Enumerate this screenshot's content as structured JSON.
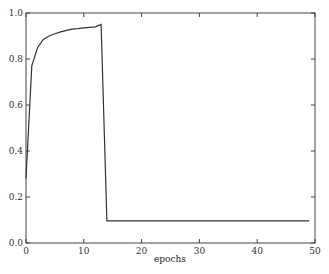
{
  "chart_data": {
    "type": "line",
    "title": "",
    "xlabel": "epochs",
    "ylabel": "",
    "xlim": [
      0,
      50
    ],
    "ylim": [
      0.0,
      1.0
    ],
    "grid": false,
    "xticks": [
      0,
      10,
      20,
      30,
      40,
      50
    ],
    "yticks": [
      0.0,
      0.2,
      0.4,
      0.6,
      0.8,
      1.0
    ],
    "xtick_labels": [
      "0",
      "10",
      "20",
      "30",
      "40",
      "50"
    ],
    "ytick_labels": [
      "0.0",
      "0.2",
      "0.4",
      "0.6",
      "0.8",
      "1.0"
    ],
    "series": [
      {
        "name": "accuracy",
        "color": "#333333",
        "x": [
          0,
          1,
          2,
          3,
          4,
          5,
          6,
          7,
          8,
          9,
          10,
          11,
          12,
          13,
          14,
          15,
          20,
          25,
          30,
          35,
          40,
          45,
          49
        ],
        "values": [
          0.28,
          0.77,
          0.85,
          0.885,
          0.9,
          0.91,
          0.918,
          0.925,
          0.93,
          0.932,
          0.935,
          0.938,
          0.94,
          0.95,
          0.096,
          0.096,
          0.096,
          0.096,
          0.096,
          0.096,
          0.096,
          0.096,
          0.096
        ]
      }
    ]
  },
  "caption": "图 1.1  (caption text partially cut off)"
}
